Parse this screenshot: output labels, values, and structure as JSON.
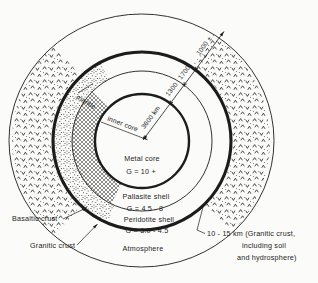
{
  "diagram": {
    "center_labels": {
      "metal_core": "Metal core",
      "metal_core_g": "G = 10 +",
      "pallasite_shell": "Pallasite shell",
      "pallasite_g": "G = 4.5 - 8",
      "peridotite_shell": "Peridotite shell",
      "peridotite_g": "G = 3.0 - 4.5",
      "atmosphere": "Atmosphere"
    },
    "region_labels": {
      "mantle": "mantle",
      "inner_core": "inner core",
      "basaltic_crust": "Basaltic crust",
      "granitic_crust": "Granitic crust"
    },
    "dimension_labels": {
      "core_radius": "3600 km",
      "pallasite_thickness": "1300",
      "peridotite_thickness": "1700",
      "atmosphere_height": "1000 ±"
    },
    "crust_note": {
      "line1": "10 - 15 km (Granitic crust,",
      "line2": "including soil",
      "line3": "and hydrosphere)"
    },
    "colors": {
      "ink": "#1c1c1c",
      "paper": "#fbfbf9"
    }
  }
}
